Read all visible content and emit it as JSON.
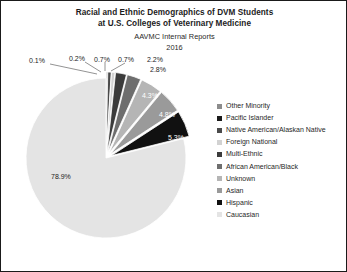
{
  "chart": {
    "title_lines": [
      "Racial and Ethnic Demographics of DVM Students",
      "at U.S. Colleges of Veterinary Medicine"
    ],
    "subtitle_lines": [
      "AAVMC Internal Reports",
      "2016"
    ]
  },
  "chart_data": {
    "type": "pie",
    "title": "Racial and Ethnic Demographics of DVM Students at U.S. Colleges of Veterinary Medicine",
    "subtitle": "AAVMC Internal Reports 2016",
    "legend_position": "right",
    "units": "percent",
    "categories": [
      "Other Minority",
      "Pacific Islander",
      "Native American/Alaskan Native",
      "Foreign National",
      "Multi-Ethnic",
      "African American/Black",
      "Unknown",
      "Asian",
      "Hispanic",
      "Caucasian"
    ],
    "values": [
      0.1,
      0.2,
      0.7,
      0.7,
      2.2,
      2.8,
      4.3,
      4.8,
      5.3,
      78.9
    ],
    "labels": [
      "0.1%",
      "0.2%",
      "0.7%",
      "0.7%",
      "2.2%",
      "2.8%",
      "4.3%",
      "4.8%",
      "5.3%",
      "78.9%"
    ],
    "colors": [
      "#8c8c8c",
      "#1a1a1a",
      "#4a4a4a",
      "#d2d2d2",
      "#3b3b3b",
      "#6e6e6e",
      "#b5b5b5",
      "#9a9a9a",
      "#111111",
      "#e4e4e4"
    ]
  },
  "legend": {
    "items": [
      {
        "label": "Other Minority",
        "color": "#8c8c8c"
      },
      {
        "label": "Pacific Islander",
        "color": "#1a1a1a"
      },
      {
        "label": "Native American/Alaskan Native",
        "color": "#4a4a4a"
      },
      {
        "label": "Foreign National",
        "color": "#d2d2d2"
      },
      {
        "label": "Multi-Ethnic",
        "color": "#3b3b3b"
      },
      {
        "label": "African American/Black",
        "color": "#6e6e6e"
      },
      {
        "label": "Unknown",
        "color": "#b5b5b5"
      },
      {
        "label": "Asian",
        "color": "#9a9a9a"
      },
      {
        "label": "Hispanic",
        "color": "#111111"
      },
      {
        "label": "Caucasian",
        "color": "#e4e4e4"
      }
    ]
  },
  "slice_labels": {
    "other_minority": "0.1%",
    "pacific_islander": "0.2%",
    "native_american": "0.7%",
    "foreign_national": "0.7%",
    "multi_ethnic": "2.2%",
    "african_american": "2.8%",
    "unknown": "4.3%",
    "asian": "4.8%",
    "hispanic": "5.3%",
    "caucasian": "78.9%"
  }
}
